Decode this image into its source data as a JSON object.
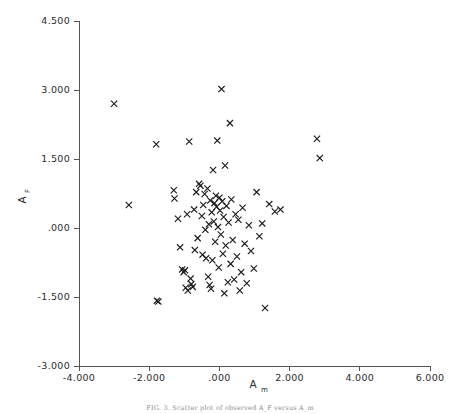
{
  "figure": {
    "caption": "FIG. 3.  Scatter plot of observed A_F versus A_m"
  },
  "chart_data": {
    "type": "scatter",
    "title": "",
    "xlabel": "A",
    "xlabel_sub": "m",
    "ylabel": "A",
    "ylabel_sub": "F",
    "xlim": [
      -4.0,
      6.0
    ],
    "ylim": [
      -3.0,
      4.5
    ],
    "xticks": [
      -4.0,
      -2.0,
      0.0,
      2.0,
      4.0,
      6.0
    ],
    "xticklabels": [
      "-4.000",
      "-2.000",
      ".000",
      "2.000",
      "4.000",
      "6.000"
    ],
    "yticks": [
      -3.0,
      -1.5,
      0.0,
      1.5,
      3.0,
      4.5
    ],
    "yticklabels": [
      "-3.000",
      "-1.500",
      ".000",
      "1.500",
      "3.000",
      "4.500"
    ],
    "grid": false,
    "legend": null,
    "marker": "x",
    "marker_color": "#1b1b1b",
    "n_points": 86,
    "points": [
      [
        -3.0,
        2.7
      ],
      [
        -2.58,
        0.5
      ],
      [
        -1.8,
        1.82
      ],
      [
        -1.78,
        -1.58
      ],
      [
        -1.74,
        -1.6
      ],
      [
        -1.3,
        0.82
      ],
      [
        -1.28,
        0.64
      ],
      [
        -1.18,
        0.2
      ],
      [
        -1.12,
        -0.42
      ],
      [
        -1.06,
        -0.9
      ],
      [
        -1.02,
        -0.96
      ],
      [
        -0.98,
        -0.92
      ],
      [
        -0.96,
        -1.3
      ],
      [
        -0.92,
        0.3
      ],
      [
        -0.9,
        -1.36
      ],
      [
        -0.86,
        1.88
      ],
      [
        -0.82,
        -1.1
      ],
      [
        -0.8,
        -1.22
      ],
      [
        -0.76,
        -1.28
      ],
      [
        -0.72,
        0.4
      ],
      [
        -0.7,
        -0.48
      ],
      [
        -0.66,
        0.78
      ],
      [
        -0.62,
        -0.22
      ],
      [
        -0.58,
        0.96
      ],
      [
        -0.54,
        0.92
      ],
      [
        -0.5,
        0.26
      ],
      [
        -0.48,
        -0.58
      ],
      [
        -0.46,
        0.5
      ],
      [
        -0.42,
        0.74
      ],
      [
        -0.4,
        -0.04
      ],
      [
        -0.38,
        -0.66
      ],
      [
        -0.34,
        0.86
      ],
      [
        -0.32,
        -1.06
      ],
      [
        -0.3,
        0.08
      ],
      [
        -0.28,
        -1.24
      ],
      [
        -0.26,
        0.6
      ],
      [
        -0.24,
        -1.32
      ],
      [
        -0.22,
        0.34
      ],
      [
        -0.2,
        -0.7
      ],
      [
        -0.18,
        1.26
      ],
      [
        -0.16,
        0.14
      ],
      [
        -0.14,
        0.54
      ],
      [
        -0.12,
        -0.3
      ],
      [
        -0.1,
        0.7
      ],
      [
        -0.08,
        0.46
      ],
      [
        -0.06,
        1.9
      ],
      [
        -0.04,
        0.02
      ],
      [
        -0.02,
        -0.86
      ],
      [
        0.0,
        0.66
      ],
      [
        0.02,
        0.38
      ],
      [
        0.04,
        -0.14
      ],
      [
        0.06,
        3.02
      ],
      [
        0.08,
        0.58
      ],
      [
        0.1,
        -0.56
      ],
      [
        0.12,
        0.24
      ],
      [
        0.14,
        -1.42
      ],
      [
        0.16,
        1.36
      ],
      [
        0.18,
        -0.38
      ],
      [
        0.2,
        0.48
      ],
      [
        0.24,
        -1.18
      ],
      [
        0.26,
        0.12
      ],
      [
        0.3,
        2.28
      ],
      [
        0.32,
        -0.78
      ],
      [
        0.34,
        0.62
      ],
      [
        0.38,
        -0.26
      ],
      [
        0.42,
        -1.12
      ],
      [
        0.46,
        0.3
      ],
      [
        0.5,
        -0.62
      ],
      [
        0.54,
        0.18
      ],
      [
        0.58,
        -1.36
      ],
      [
        0.62,
        -0.96
      ],
      [
        0.66,
        0.44
      ],
      [
        0.72,
        -0.34
      ],
      [
        0.78,
        -1.2
      ],
      [
        0.84,
        0.06
      ],
      [
        0.9,
        -0.5
      ],
      [
        0.98,
        -0.88
      ],
      [
        1.06,
        0.78
      ],
      [
        1.14,
        -0.18
      ],
      [
        1.22,
        0.1
      ],
      [
        1.3,
        -1.74
      ],
      [
        1.42,
        0.52
      ],
      [
        1.58,
        0.36
      ],
      [
        1.74,
        0.4
      ],
      [
        2.78,
        1.94
      ],
      [
        2.86,
        1.52
      ]
    ]
  }
}
